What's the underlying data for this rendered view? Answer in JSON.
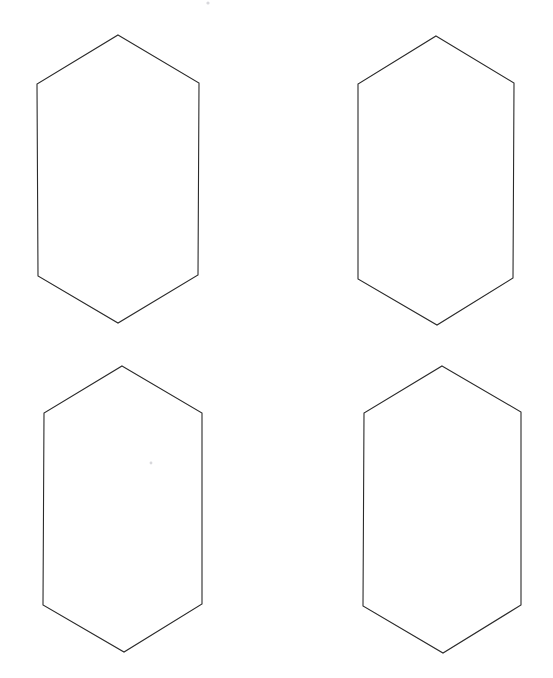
{
  "page": {
    "background_color": "#ffffff",
    "width": 553,
    "height": 678
  },
  "style": {
    "stroke_color": "#2b2b2b",
    "stroke_width": 1.1,
    "fill": "none",
    "speck_color": "#d8d8dc"
  },
  "figure": {
    "shape_name": "hexagon",
    "shape_count": 4,
    "rows": 2,
    "columns": 2,
    "orientation": "vertical-elongated"
  },
  "shapes": [
    {
      "id": "hexagon-top-left",
      "label": "Hexagon 1",
      "row": 1,
      "column": 1,
      "points": "118,35 199,83 198,275 118,323 38,276 37,84",
      "apex_top": [
        118,
        35
      ],
      "apex_bottom": [
        118,
        323
      ],
      "width": 162,
      "height": 288
    },
    {
      "id": "hexagon-top-right",
      "label": "Hexagon 2",
      "row": 1,
      "column": 2,
      "points": "436,36 514,83 513,278 437,325 358,279 358,84",
      "apex_top": [
        436,
        36
      ],
      "apex_bottom": [
        437,
        325
      ],
      "width": 156,
      "height": 289
    },
    {
      "id": "hexagon-bottom-left",
      "label": "Hexagon 3",
      "row": 2,
      "column": 1,
      "points": "122,366 202,413 202,604 124,652 43,605 44,413",
      "apex_top": [
        122,
        366
      ],
      "apex_bottom": [
        124,
        652
      ],
      "width": 159,
      "height": 286
    },
    {
      "id": "hexagon-bottom-right",
      "label": "Hexagon 4",
      "row": 2,
      "column": 2,
      "points": "442,366 521,412 521,605 443,653 363,606 364,413",
      "apex_top": [
        442,
        366
      ],
      "apex_bottom": [
        443,
        653
      ],
      "width": 158,
      "height": 287
    }
  ],
  "artifacts": [
    {
      "id": "speck-top",
      "cx": 208,
      "cy": 3,
      "r": 1.6
    },
    {
      "id": "speck-middle",
      "cx": 151,
      "cy": 463,
      "r": 1.4
    }
  ]
}
